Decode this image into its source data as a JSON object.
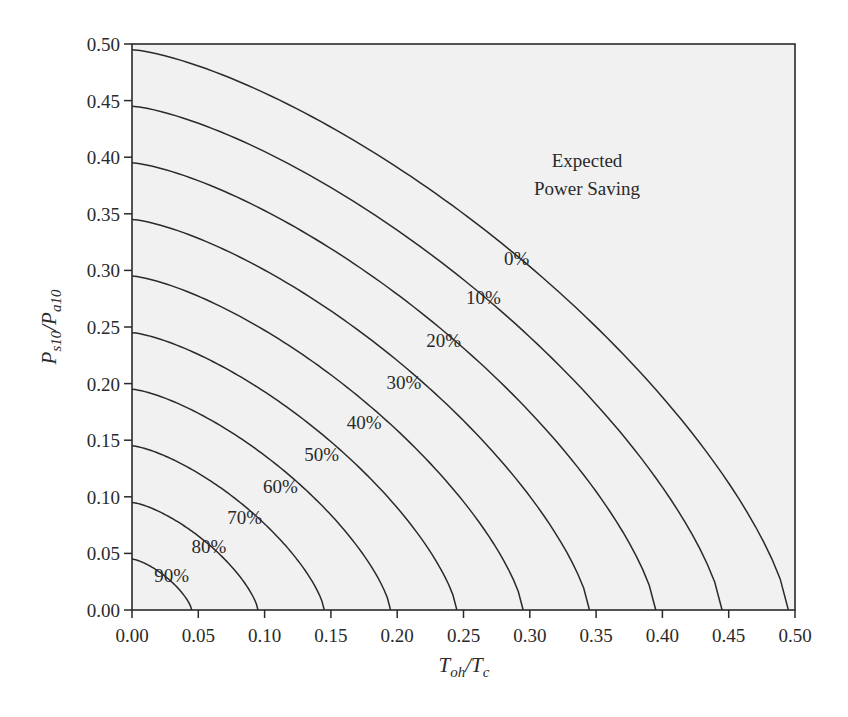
{
  "chart_data": {
    "type": "line",
    "title": "",
    "xlabel": "T_oh/T_c",
    "ylabel": "P_s10/P_a10",
    "xlim": [
      0.0,
      0.5
    ],
    "ylim": [
      0.0,
      0.5
    ],
    "grid": false,
    "legend": "none (curves labeled inline)",
    "x_ticks": [
      "0.00",
      "0.05",
      "0.10",
      "0.15",
      "0.20",
      "0.25",
      "0.30",
      "0.35",
      "0.40",
      "0.45",
      "0.50"
    ],
    "y_ticks": [
      "0.00",
      "0.05",
      "0.10",
      "0.15",
      "0.20",
      "0.25",
      "0.30",
      "0.35",
      "0.40",
      "0.45",
      "0.50"
    ],
    "annotation": [
      "Expected",
      "Power Saving"
    ],
    "series": [
      {
        "name": "0%",
        "y_intercept": 0.495,
        "x_intercept": 0.495
      },
      {
        "name": "10%",
        "y_intercept": 0.445,
        "x_intercept": 0.445
      },
      {
        "name": "20%",
        "y_intercept": 0.395,
        "x_intercept": 0.395
      },
      {
        "name": "30%",
        "y_intercept": 0.345,
        "x_intercept": 0.345
      },
      {
        "name": "40%",
        "y_intercept": 0.295,
        "x_intercept": 0.295
      },
      {
        "name": "50%",
        "y_intercept": 0.245,
        "x_intercept": 0.245
      },
      {
        "name": "60%",
        "y_intercept": 0.195,
        "x_intercept": 0.195
      },
      {
        "name": "70%",
        "y_intercept": 0.145,
        "x_intercept": 0.145
      },
      {
        "name": "80%",
        "y_intercept": 0.095,
        "x_intercept": 0.095
      },
      {
        "name": "90%",
        "y_intercept": 0.045,
        "x_intercept": 0.045
      }
    ],
    "label_positions": [
      {
        "name": "0%",
        "x": 0.29,
        "y": 0.305
      },
      {
        "name": "10%",
        "x": 0.265,
        "y": 0.27
      },
      {
        "name": "20%",
        "y": 0.232,
        "x": 0.235
      },
      {
        "name": "30%",
        "x": 0.205,
        "y": 0.195
      },
      {
        "name": "40%",
        "x": 0.175,
        "y": 0.16
      },
      {
        "name": "50%",
        "x": 0.143,
        "y": 0.132
      },
      {
        "name": "60%",
        "x": 0.112,
        "y": 0.103
      },
      {
        "name": "70%",
        "x": 0.085,
        "y": 0.076
      },
      {
        "name": "80%",
        "x": 0.058,
        "y": 0.05
      },
      {
        "name": "90%",
        "x": 0.03,
        "y": 0.025
      }
    ]
  },
  "colors": {
    "plot_background": "#f1f1f1",
    "line": "#2a2a2a",
    "text": "#2a2a2a"
  },
  "axes": {
    "x_title_main": "T",
    "x_title_sub1": "oh",
    "x_title_slash": "/T",
    "x_title_sub2": "c",
    "y_title_main": "P",
    "y_title_sub1": "s10",
    "y_title_slash": "/P",
    "y_title_sub2": "a10"
  }
}
